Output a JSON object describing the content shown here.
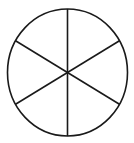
{
  "figure": {
    "background_color": "#ffffff",
    "canvas": {
      "width": 134,
      "height": 143
    }
  },
  "chart_data": {
    "type": "pie",
    "xlabel": "",
    "ylabel": "",
    "categories": [
      "Sector 1",
      "Sector 2",
      "Sector 3",
      "Sector 4",
      "Sector 5",
      "Sector 6"
    ],
    "values": [
      1,
      1,
      1,
      1,
      1,
      1
    ],
    "percentages": [
      16.67,
      16.67,
      16.67,
      16.67,
      16.67,
      16.67
    ],
    "slice_angle_degrees": 60,
    "slice_count": 6,
    "labels_shown": false,
    "legend": false,
    "legend_position": "none",
    "grid": false,
    "slice_fill_color": "#ffffff",
    "outline_color": "#1a1a1a",
    "outline_width": 1.6,
    "start_angle_degrees": 90,
    "geometry": {
      "center_x": 67.5,
      "center_y": 72.5,
      "radius_x": 60,
      "radius_y": 63.5,
      "divider_count": 3,
      "divider_angles_degrees": [
        90,
        30,
        150
      ]
    }
  },
  "shape": {
    "kind": "circle",
    "stroke_color": "#1a1a1a",
    "fill_color": "#ffffff",
    "stroke_width": 1.6,
    "center": {
      "x": 67.5,
      "y": 72.5
    },
    "radius": {
      "x": 60,
      "y": 63.5
    }
  },
  "dividers": [
    {
      "name": "vertical-diameter",
      "angle_degrees": 90,
      "x1": 67.5,
      "y1": 9.0,
      "x2": 67.5,
      "y2": 136.0
    },
    {
      "name": "upper-right-to-lower-left-diameter",
      "angle_degrees": 30,
      "x1": 119.46,
      "y1": 40.75,
      "x2": 15.54,
      "y2": 104.25
    },
    {
      "name": "upper-left-to-lower-right-diameter",
      "angle_degrees": 150,
      "x1": 15.54,
      "y1": 40.75,
      "x2": 119.46,
      "y2": 104.25
    }
  ],
  "sectors": [
    {
      "name": "sector-top-right",
      "start_deg": 30,
      "end_deg": 90,
      "label": "Sector 1"
    },
    {
      "name": "sector-top-left",
      "start_deg": 90,
      "end_deg": 150,
      "label": "Sector 2"
    },
    {
      "name": "sector-left",
      "start_deg": 150,
      "end_deg": 210,
      "label": "Sector 3"
    },
    {
      "name": "sector-bottom-left",
      "start_deg": 210,
      "end_deg": 270,
      "label": "Sector 4"
    },
    {
      "name": "sector-bottom-right",
      "start_deg": 270,
      "end_deg": 330,
      "label": "Sector 5"
    },
    {
      "name": "sector-right",
      "start_deg": 330,
      "end_deg": 390,
      "label": "Sector 6"
    }
  ]
}
